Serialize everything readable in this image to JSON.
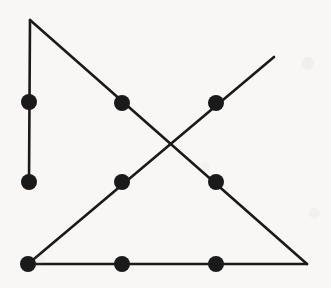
{
  "figure": {
    "kind": "line-drawing-graph",
    "canvas": {
      "width": 331,
      "height": 288
    },
    "background_color": "#f8f7f5",
    "ink_color": "#1a1a1a",
    "stroke_width": 2.6,
    "vertex_radius": 8,
    "vertices": [
      {
        "id": "v1",
        "name": "left-upper-vertex",
        "x": 29,
        "y": 102
      },
      {
        "id": "v2",
        "name": "left-lower-vertex",
        "x": 29,
        "y": 182
      },
      {
        "id": "v3",
        "name": "bottom-left-vertex",
        "x": 28,
        "y": 264
      },
      {
        "id": "v4",
        "name": "upper-middle-vertex",
        "x": 122,
        "y": 103
      },
      {
        "id": "v5",
        "name": "center-left-vertex",
        "x": 122,
        "y": 182
      },
      {
        "id": "v6",
        "name": "bottom-middle-vertex",
        "x": 122,
        "y": 264
      },
      {
        "id": "v7",
        "name": "upper-right-vertex",
        "x": 216,
        "y": 103
      },
      {
        "id": "v8",
        "name": "center-right-vertex",
        "x": 216,
        "y": 182
      },
      {
        "id": "v9",
        "name": "bottom-right-vertex",
        "x": 216,
        "y": 264
      }
    ],
    "edges": [
      {
        "id": "e1",
        "name": "apex-to-left-lower-vertical-line",
        "x1": 30,
        "y1": 20,
        "x2": 29,
        "y2": 182
      },
      {
        "id": "e2",
        "name": "apex-to-bottom-right-descending-line",
        "x1": 30,
        "y1": 20,
        "x2": 307,
        "y2": 264
      },
      {
        "id": "e3",
        "name": "bottom-left-to-upper-right-ascending-line",
        "x1": 28,
        "y1": 264,
        "x2": 274,
        "y2": 57
      },
      {
        "id": "e4",
        "name": "bottom-horizontal-base-line",
        "x1": 28,
        "y1": 264,
        "x2": 307,
        "y2": 264
      }
    ],
    "free_endpoints": [
      {
        "id": "p-apex",
        "name": "triangle-apex-point",
        "x": 30,
        "y": 20
      },
      {
        "id": "p-br",
        "name": "triangle-bottom-right-corner",
        "x": 307,
        "y": 264
      },
      {
        "id": "p-ur",
        "name": "ascending-line-upper-end",
        "x": 274,
        "y": 57
      }
    ],
    "crossing_point": {
      "name": "diagonal-crossing-point",
      "x": 170,
      "y": 143
    },
    "counts": {
      "vertices": 9,
      "edges": 4
    }
  }
}
